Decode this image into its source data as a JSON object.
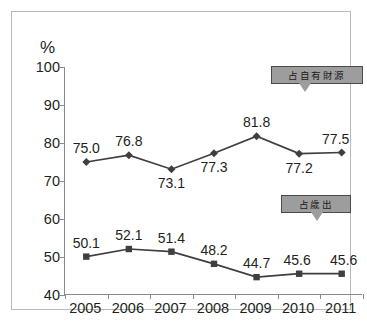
{
  "chart_data": {
    "type": "line",
    "title": "",
    "xlabel": "",
    "ylabel": "%",
    "categories": [
      "2005",
      "2006",
      "2007",
      "2008",
      "2009",
      "2010",
      "2011"
    ],
    "ylim": [
      40,
      100
    ],
    "y_ticks": [
      "40",
      "50",
      "60",
      "70",
      "80",
      "90",
      "100"
    ],
    "grid": false,
    "legend_position": "callout-annotations",
    "series": [
      {
        "name": "占自有財源",
        "marker": "diamond",
        "color": "#3f3f3f",
        "values": [
          75.0,
          76.8,
          73.1,
          77.3,
          81.8,
          77.2,
          77.5
        ],
        "labels": [
          "75.0",
          "76.8",
          "73.1",
          "77.3",
          "81.8",
          "77.2",
          "77.5"
        ],
        "label_positions": [
          "above",
          "above",
          "below",
          "below",
          "above",
          "below",
          "above"
        ]
      },
      {
        "name": "占歲出",
        "marker": "square",
        "color": "#3f3f3f",
        "values": [
          50.1,
          52.1,
          51.4,
          48.2,
          44.7,
          45.6,
          45.6
        ],
        "labels": [
          "50.1",
          "52.1",
          "51.4",
          "48.2",
          "44.7",
          "45.6",
          "45.6"
        ],
        "label_positions": [
          "above",
          "above",
          "above",
          "above",
          "above",
          "above",
          "above"
        ]
      }
    ],
    "annotations": [
      {
        "text": "占自有財源",
        "target_series": 0
      },
      {
        "text": "占歲出",
        "target_series": 1
      }
    ]
  },
  "axis": {
    "unit_label": "%"
  },
  "colors": {
    "line": "#3f3f3f",
    "axis": "#8a8a8a",
    "frame": "#b9b9b9",
    "callout_fill": "#9d9d9d",
    "callout_border": "#4a4a4a",
    "text": "#231f20"
  }
}
